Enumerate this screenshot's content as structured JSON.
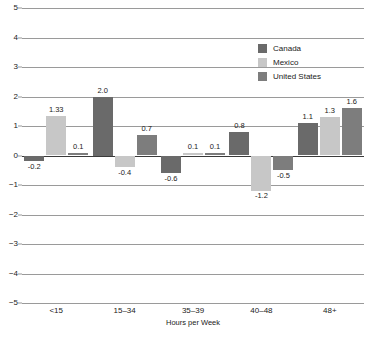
{
  "chart_data": {
    "type": "bar",
    "title": "",
    "subtitle": "",
    "xlabel": "Hours per Week",
    "ylabel": "",
    "categories": [
      "<15",
      "15–34",
      "35–39",
      "40–48",
      "48+"
    ],
    "series": [
      {
        "name": "Canada",
        "color": "#6a6a6a",
        "values": [
          -0.2,
          2.0,
          -0.6,
          0.8,
          1.1
        ],
        "labels": [
          "-0.2",
          "2.0",
          "-0.6",
          "0.8",
          "1.1"
        ]
      },
      {
        "name": "Mexico",
        "color": "#c7c7c7",
        "values": [
          1.33,
          -0.4,
          0.1,
          -1.2,
          1.3
        ],
        "labels": [
          "1.33",
          "-0.4",
          "0.1",
          "-1.2",
          "1.3"
        ]
      },
      {
        "name": "United States",
        "color": "#7d7d7d",
        "values": [
          0.1,
          0.7,
          0.1,
          -0.5,
          1.6
        ],
        "labels": [
          "0.1",
          "0.7",
          "0.1",
          "-0.5",
          "1.6"
        ]
      }
    ],
    "ylim": [
      -5,
      5
    ],
    "yticks": [
      5,
      4,
      3,
      2,
      1,
      0,
      -1,
      -2,
      -3,
      -4,
      -5
    ],
    "ytick_labels": [
      "5",
      "4",
      "3",
      "2",
      "1",
      "0",
      "−1",
      "−2",
      "−3",
      "−4",
      "−5"
    ],
    "grid": true,
    "legend_position": "upper-right-inside"
  },
  "legend": {
    "items": [
      {
        "label": "Canada",
        "color": "#6a6a6a"
      },
      {
        "label": "Mexico",
        "color": "#c7c7c7"
      },
      {
        "label": "United States",
        "color": "#7d7d7d"
      }
    ]
  },
  "axes": {
    "x_title": "Hours per Week"
  }
}
